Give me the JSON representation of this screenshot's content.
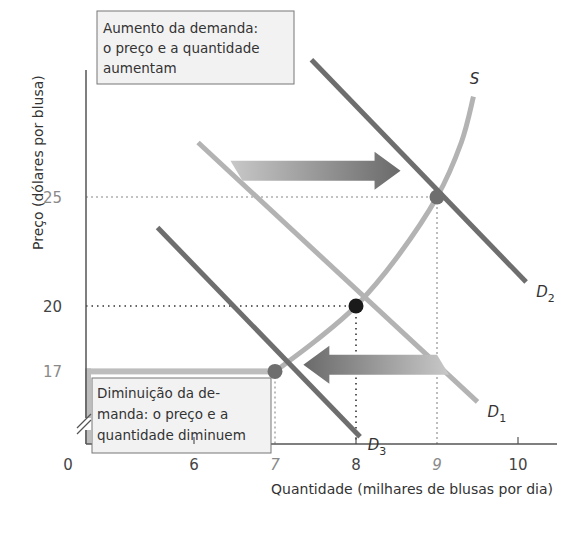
{
  "chart_data": {
    "type": "line",
    "title": "",
    "xlabel": "Quantidade (milhares de blusas por dia)",
    "ylabel": "Preço (dólares por blusa)",
    "xlim": [
      5.3,
      10.5
    ],
    "ylim": [
      13,
      31
    ],
    "x_ticks": [
      {
        "value": 0,
        "label": "0",
        "position": "origin"
      },
      {
        "value": 6,
        "label": "6",
        "highlight": false
      },
      {
        "value": 7,
        "label": "7",
        "highlight": true
      },
      {
        "value": 8,
        "label": "8",
        "highlight": false
      },
      {
        "value": 9,
        "label": "9",
        "highlight": true
      },
      {
        "value": 10,
        "label": "10",
        "highlight": false
      }
    ],
    "y_ticks": [
      {
        "value": 25,
        "label": "25",
        "highlight": true
      },
      {
        "value": 20,
        "label": "20",
        "highlight": false
      },
      {
        "value": 17,
        "label": "17",
        "highlight": true
      }
    ],
    "axis_breaks": [
      "x",
      "y"
    ],
    "series": [
      {
        "name": "S",
        "label_main": "S",
        "label_sub": "",
        "kind": "supply",
        "color": "#b3b3b3",
        "points": [
          [
            7,
            17
          ],
          [
            7.5,
            18.4
          ],
          [
            8,
            20
          ],
          [
            8.5,
            22.2
          ],
          [
            9,
            25
          ],
          [
            9.3,
            27.5
          ],
          [
            9.45,
            29.6
          ]
        ]
      },
      {
        "name": "D1",
        "label_main": "D",
        "label_sub": "1",
        "kind": "demand",
        "color": "#b3b3b3",
        "points": [
          [
            6.05,
            27.5
          ],
          [
            9.5,
            15.6
          ]
        ]
      },
      {
        "name": "D2",
        "label_main": "D",
        "label_sub": "2",
        "kind": "demand",
        "color": "#6e6e6e",
        "points": [
          [
            7.45,
            31.3
          ],
          [
            10.1,
            21.1
          ]
        ]
      },
      {
        "name": "D3",
        "label_main": "D",
        "label_sub": "3",
        "kind": "demand",
        "color": "#6e6e6e",
        "points": [
          [
            5.55,
            23.6
          ],
          [
            8.05,
            14.0
          ]
        ]
      }
    ],
    "equilibria": [
      {
        "name": "initial",
        "x": 8,
        "y": 20,
        "color": "#1a1a1a"
      },
      {
        "name": "increase",
        "x": 9,
        "y": 25,
        "color": "#6e6e6e"
      },
      {
        "name": "decrease",
        "x": 7,
        "y": 17,
        "color": "#6e6e6e"
      }
    ],
    "guides": [
      {
        "x": 9,
        "y": 25,
        "style": "light"
      },
      {
        "x": 8,
        "y": 20,
        "style": "dark"
      },
      {
        "x": 7,
        "y": 17,
        "style": "light"
      }
    ],
    "arrows": [
      {
        "name": "shift-right",
        "direction": "right",
        "from": [
          6.45,
          26.2
        ],
        "to": [
          8.55,
          26.2
        ]
      },
      {
        "name": "shift-left",
        "direction": "left",
        "from": [
          9.0,
          17.3
        ],
        "to": [
          7.35,
          17.3
        ]
      }
    ],
    "annotations": [
      {
        "name": "increase-box",
        "lines": [
          "Aumento da demanda:",
          "o preço e a quantidade",
          "aumentam"
        ]
      },
      {
        "name": "decrease-box",
        "lines": [
          "Diminuição da de-",
          "manda: o preço e a",
          "quantidade diminuem"
        ]
      }
    ]
  }
}
